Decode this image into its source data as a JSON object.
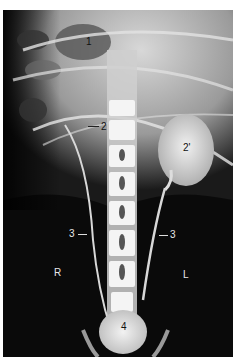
{
  "figure": {
    "type": "radiograph",
    "labels": [
      {
        "id": "1",
        "text": "1"
      },
      {
        "id": "2",
        "text": "2"
      },
      {
        "id": "2p",
        "text": "2'"
      },
      {
        "id": "3r",
        "text": "3"
      },
      {
        "id": "3l",
        "text": "3"
      },
      {
        "id": "R",
        "text": "R"
      },
      {
        "id": "L",
        "text": "L"
      },
      {
        "id": "4",
        "text": "4"
      }
    ]
  }
}
